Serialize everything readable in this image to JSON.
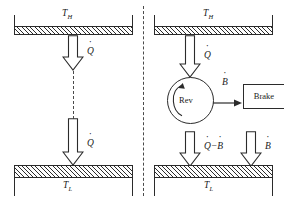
{
  "figure": {
    "type": "thermodynamics-diagram",
    "title": "",
    "background_color": "#ffffff",
    "line_color": "#2b2b2b",
    "divider": {
      "style": "dashed",
      "orientation": "vertical"
    }
  },
  "panels": [
    {
      "id": "left",
      "caption": "",
      "hot_reservoir": {
        "label": "T",
        "subscript": "H"
      },
      "cold_reservoir": {
        "label": "T",
        "subscript": "L"
      },
      "arrows": [
        {
          "name": "heat-from-hot",
          "label": "Q",
          "dot": true,
          "direction": "down"
        },
        {
          "name": "heat-into-cold",
          "label": "Q",
          "dot": true,
          "direction": "down"
        }
      ],
      "connector": {
        "style": "dashed"
      }
    },
    {
      "id": "right",
      "caption": "",
      "hot_reservoir": {
        "label": "T",
        "subscript": "H"
      },
      "cold_reservoir": {
        "label": "T",
        "subscript": "L"
      },
      "engine": {
        "name": "reversible-engine",
        "label": "Rev",
        "rotation": "counterclockwise"
      },
      "brake": {
        "name": "brake",
        "label": "Brake"
      },
      "arrows": [
        {
          "name": "heat-from-hot",
          "label": "Q",
          "dot": true,
          "direction": "down"
        },
        {
          "name": "work-to-brake",
          "label": "B",
          "dot": true,
          "direction": "right"
        },
        {
          "name": "heat-into-cold-net",
          "label": "Q",
          "dot": true,
          "operator": "−",
          "label2": "B",
          "dot2": true,
          "direction": "down"
        },
        {
          "name": "brake-dissipation-into-cold",
          "label": "B",
          "dot": true,
          "direction": "down"
        }
      ]
    }
  ],
  "symbols": {
    "Qdot": "Q",
    "Bdot": "B",
    "minus": "−",
    "T_H": "T",
    "T_H_sub": "H",
    "T_L": "T",
    "T_L_sub": "L",
    "rev": "Rev",
    "brake": "Brake"
  }
}
